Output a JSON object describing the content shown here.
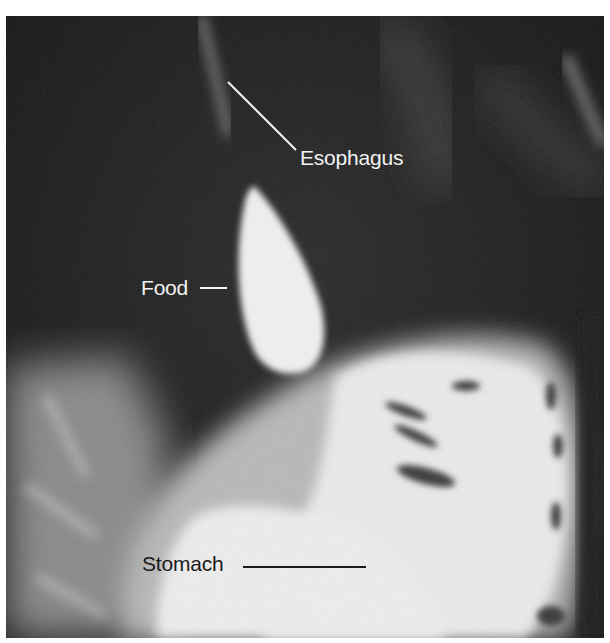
{
  "figure": {
    "labels": [
      {
        "id": "esophagus",
        "text": "Esophagus",
        "color": "#f2f2f2"
      },
      {
        "id": "food",
        "text": "Food",
        "color": "#f2f2f2"
      },
      {
        "id": "stomach",
        "text": "Stomach",
        "color": "#1a1a1a"
      }
    ]
  }
}
